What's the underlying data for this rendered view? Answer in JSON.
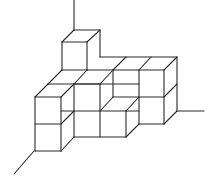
{
  "diagram": {
    "type": "isometric-cube-stack",
    "stroke_color": "#2a2a2a",
    "background": "#ffffff",
    "axes": {
      "vertical": [
        [
          74,
          0
        ],
        [
          74,
          30
        ]
      ],
      "right": [
        [
          177,
          111
        ],
        [
          204,
          111
        ]
      ],
      "left": [
        [
          34,
          151
        ],
        [
          14,
          174
        ]
      ]
    },
    "lines": [
      [
        [
          74,
          30
        ],
        [
          100,
          30
        ]
      ],
      [
        [
          62,
          42
        ],
        [
          87,
          42
        ]
      ],
      [
        [
          74,
          30
        ],
        [
          62,
          42
        ]
      ],
      [
        [
          100,
          30
        ],
        [
          87,
          42
        ]
      ],
      [
        [
          62,
          42
        ],
        [
          62,
          70
        ]
      ],
      [
        [
          87,
          42
        ],
        [
          87,
          70
        ]
      ],
      [
        [
          100,
          30
        ],
        [
          100,
          57
        ]
      ],
      [
        [
          100,
          57
        ],
        [
          177,
          57
        ]
      ],
      [
        [
          87,
          70
        ],
        [
          164,
          70
        ]
      ],
      [
        [
          62,
          70
        ],
        [
          87,
          70
        ]
      ],
      [
        [
          48,
          84
        ],
        [
          139,
          84
        ]
      ],
      [
        [
          35,
          97
        ],
        [
          61,
          97
        ]
      ],
      [
        [
          74,
          84
        ],
        [
          100,
          84
        ]
      ],
      [
        [
          126,
          57
        ],
        [
          113,
          70
        ]
      ],
      [
        [
          151,
          57
        ],
        [
          139,
          70
        ]
      ],
      [
        [
          177,
          57
        ],
        [
          164,
          70
        ]
      ],
      [
        [
          87,
          70
        ],
        [
          74,
          84
        ]
      ],
      [
        [
          62,
          70
        ],
        [
          48,
          84
        ]
      ],
      [
        [
          113,
          70
        ],
        [
          100,
          84
        ]
      ],
      [
        [
          48,
          84
        ],
        [
          35,
          97
        ]
      ],
      [
        [
          74,
          84
        ],
        [
          61,
          97
        ]
      ],
      [
        [
          35,
          97
        ],
        [
          35,
          151
        ]
      ],
      [
        [
          61,
          97
        ],
        [
          61,
          151
        ]
      ],
      [
        [
          35,
          124
        ],
        [
          61,
          124
        ]
      ],
      [
        [
          35,
          151
        ],
        [
          61,
          151
        ]
      ],
      [
        [
          74,
          84
        ],
        [
          74,
          137
        ]
      ],
      [
        [
          61,
          111
        ],
        [
          74,
          111
        ]
      ],
      [
        [
          61,
          151
        ],
        [
          74,
          137
        ]
      ],
      [
        [
          61,
          124
        ],
        [
          74,
          111
        ]
      ],
      [
        [
          100,
          84
        ],
        [
          100,
          137
        ]
      ],
      [
        [
          74,
          111
        ],
        [
          139,
          111
        ]
      ],
      [
        [
          74,
          137
        ],
        [
          126,
          137
        ]
      ],
      [
        [
          113,
          70
        ],
        [
          113,
          97
        ]
      ],
      [
        [
          113,
          97
        ],
        [
          139,
          97
        ]
      ],
      [
        [
          100,
          111
        ],
        [
          113,
          97
        ]
      ],
      [
        [
          139,
          70
        ],
        [
          139,
          124
        ]
      ],
      [
        [
          164,
          70
        ],
        [
          164,
          124
        ]
      ],
      [
        [
          139,
          97
        ],
        [
          164,
          97
        ]
      ],
      [
        [
          139,
          124
        ],
        [
          164,
          124
        ]
      ],
      [
        [
          177,
          57
        ],
        [
          177,
          111
        ]
      ],
      [
        [
          164,
          97
        ],
        [
          177,
          84
        ]
      ],
      [
        [
          164,
          124
        ],
        [
          177,
          111
        ]
      ],
      [
        [
          126,
          111
        ],
        [
          126,
          137
        ]
      ],
      [
        [
          126,
          111
        ],
        [
          139,
          97
        ]
      ],
      [
        [
          126,
          137
        ],
        [
          139,
          124
        ]
      ]
    ]
  }
}
